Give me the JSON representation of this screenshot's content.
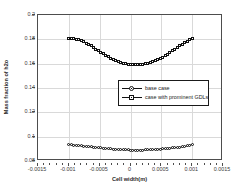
{
  "chart_data": {
    "type": "line",
    "title": "",
    "xlabel": "Cell width(m)",
    "ylabel": "Mass fraction of h2o",
    "xlim": [
      -0.0015,
      0.0015
    ],
    "ylim": [
      0.08,
      0.2
    ],
    "xticks": [
      "-0.0015",
      "-0.001",
      "-0.0005",
      "0",
      "0.0005",
      "0.001",
      "0.0015"
    ],
    "xtick_values": [
      -0.0015,
      -0.001,
      -0.0005,
      0,
      0.0005,
      0.001,
      0.0015
    ],
    "yticks": [
      "0.08",
      "0.1",
      "0.12",
      "0.14",
      "0.16",
      "0.18",
      "0.2"
    ],
    "ytick_values": [
      0.08,
      0.1,
      0.12,
      0.14,
      0.16,
      0.18,
      0.2
    ],
    "grid": true,
    "legend_position": "center",
    "x": [
      -0.001,
      -0.00096,
      -0.00092,
      -0.00088,
      -0.00084,
      -0.0008,
      -0.00076,
      -0.00072,
      -0.00068,
      -0.00064,
      -0.0006,
      -0.00056,
      -0.00052,
      -0.00048,
      -0.00044,
      -0.0004,
      -0.00036,
      -0.00032,
      -0.00028,
      -0.00024,
      -0.0002,
      -0.00016,
      -0.00012,
      -8e-05,
      -4e-05,
      0.0,
      4e-05,
      8e-05,
      0.00012,
      0.00016,
      0.0002,
      0.00024,
      0.00028,
      0.00032,
      0.00036,
      0.0004,
      0.00044,
      0.00048,
      0.00052,
      0.00056,
      0.0006,
      0.00064,
      0.00068,
      0.00072,
      0.00076,
      0.0008,
      0.00084,
      0.00088,
      0.00092,
      0.00096,
      0.001
    ],
    "series": [
      {
        "name": "base case",
        "marker": "circle",
        "color": "#111111",
        "values": [
          0.0935,
          0.0933,
          0.0931,
          0.0929,
          0.09268,
          0.09246,
          0.09224,
          0.09202,
          0.0918,
          0.09158,
          0.09136,
          0.09114,
          0.09094,
          0.09074,
          0.09054,
          0.09034,
          0.09016,
          0.08998,
          0.08982,
          0.08966,
          0.08952,
          0.08938,
          0.08926,
          0.08916,
          0.08908,
          0.08902,
          0.08898,
          0.08896,
          0.08896,
          0.08898,
          0.08902,
          0.08908,
          0.08916,
          0.08926,
          0.08938,
          0.08952,
          0.08966,
          0.08982,
          0.08998,
          0.09016,
          0.09034,
          0.09054,
          0.09074,
          0.09094,
          0.09114,
          0.09136,
          0.09158,
          0.0919,
          0.0924,
          0.093,
          0.0935
        ]
      },
      {
        "name": "case with prominent GDLs",
        "marker": "square",
        "color": "#111111",
        "values": [
          0.1808,
          0.1808,
          0.1806,
          0.1802,
          0.1796,
          0.1788,
          0.1779,
          0.1769,
          0.1758,
          0.1746,
          0.1733,
          0.172,
          0.1707,
          0.1694,
          0.1681,
          0.1668,
          0.1656,
          0.1645,
          0.1635,
          0.1626,
          0.1618,
          0.1611,
          0.1605,
          0.16,
          0.1596,
          0.1593,
          0.1591,
          0.159,
          0.15905,
          0.1592,
          0.15945,
          0.1598,
          0.16025,
          0.1608,
          0.1615,
          0.1623,
          0.1632,
          0.1642,
          0.1653,
          0.1665,
          0.1678,
          0.1691,
          0.1705,
          0.1719,
          0.1733,
          0.1747,
          0.1761,
          0.1774,
          0.1786,
          0.1797,
          0.1808
        ]
      }
    ]
  }
}
